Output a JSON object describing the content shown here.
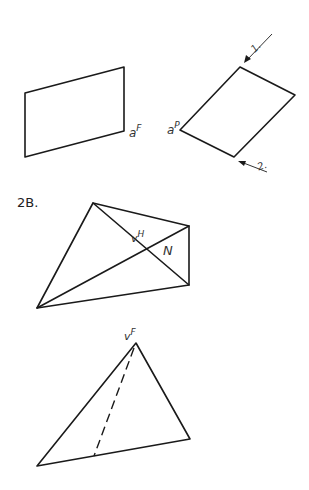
{
  "figure_1": {
    "front_view_label_base": "a",
    "front_view_label_sup": "F",
    "plane_view_label_base": "a",
    "plane_view_label_sup": "P",
    "arrow_1_label": "1.",
    "arrow_2_label": "2."
  },
  "figure_2B": {
    "title": "2B.",
    "top_view_label_base": "v",
    "top_view_label_sup": "H",
    "top_view_face_label": "N",
    "front_view_label_base": "v",
    "front_view_label_sup": "F"
  },
  "colors": {
    "line": "#1a1a1a",
    "label": "#333333",
    "background": "#ffffff"
  }
}
